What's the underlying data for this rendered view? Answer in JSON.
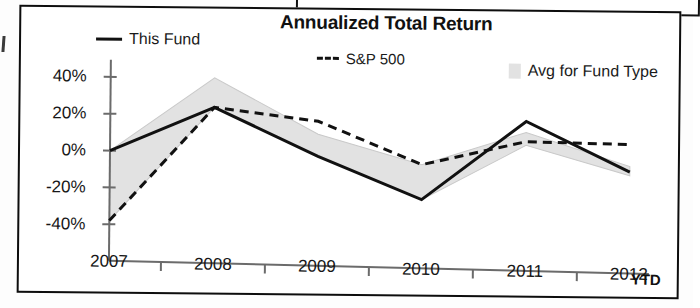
{
  "chart_data": {
    "type": "line",
    "title": "Annualized Total Return",
    "xlabel": "",
    "ylabel": "",
    "categories": [
      "2007",
      "2008",
      "2009",
      "2010",
      "2011",
      "2012"
    ],
    "last_category_note": "YTD",
    "ylim": [
      -50,
      45
    ],
    "yticks": [
      40,
      20,
      0,
      -20,
      -40
    ],
    "ytick_labels": [
      "40%",
      "20%",
      "0%",
      "-20%",
      "-40%"
    ],
    "grid": false,
    "legend_position": "top",
    "series": [
      {
        "name": "This Fund",
        "style": "solid",
        "color": "#111111",
        "values": [
          0,
          24,
          -2,
          -25,
          18,
          -9
        ]
      },
      {
        "name": "S&P 500",
        "style": "dashed",
        "color": "#111111",
        "values": [
          -38,
          24,
          17,
          -6,
          7,
          6
        ]
      },
      {
        "name": "Avg for Fund Type",
        "style": "band",
        "color": "#e2e2e2",
        "values": [
          -38,
          40,
          10,
          -25,
          12,
          -11
        ],
        "band_upper": [
          0,
          40,
          10,
          -6,
          12,
          -6
        ],
        "band_lower": [
          -38,
          24,
          -2,
          -25,
          5,
          -11
        ]
      }
    ]
  },
  "legend": {
    "fund_label": "This Fund",
    "sp_label": "S&P 500",
    "sp_marker": "---",
    "avg_label": "Avg for Fund Type"
  },
  "axes": {
    "y_labels": [
      "40%",
      "20%",
      "0%",
      "-20%",
      "-40%"
    ],
    "x_labels": [
      "2007",
      "2008",
      "2009",
      "2010",
      "2011",
      "2012"
    ],
    "ytd": "YTD"
  }
}
